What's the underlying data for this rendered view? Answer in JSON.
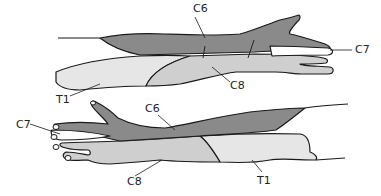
{
  "diagram": {
    "type": "dermatome-map",
    "colors": {
      "c6": "#8a8a8a",
      "c7": "#ffffff",
      "c8": "#cfcfcf",
      "t1": "#e6e6e6",
      "outline": "#1a1a1a"
    },
    "top_arm": {
      "labels": [
        {
          "id": "c6",
          "text": "C6"
        },
        {
          "id": "c7",
          "text": "C7"
        },
        {
          "id": "c8",
          "text": "C8"
        },
        {
          "id": "t1",
          "text": "T1"
        }
      ]
    },
    "bottom_arm": {
      "labels": [
        {
          "id": "c6",
          "text": "C6"
        },
        {
          "id": "c7",
          "text": "C7"
        },
        {
          "id": "c8",
          "text": "C8"
        },
        {
          "id": "t1",
          "text": "T1"
        }
      ]
    }
  }
}
